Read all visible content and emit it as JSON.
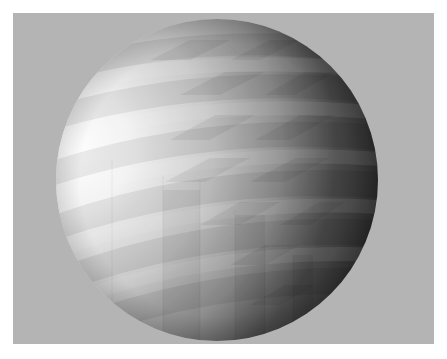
{
  "scene": {
    "description": "Flat-shaded faceted 3D sphere rendered on gray background",
    "background_color": "#b4b4b4",
    "border_color": "#ffffff",
    "sphere": {
      "center": [
        217,
        180
      ],
      "radius": 161,
      "highlight_color": "#ffffff",
      "mid_color": "#a8a8a8",
      "shadow_color": "#2a2a2a",
      "light_direction": "upper-left"
    }
  }
}
